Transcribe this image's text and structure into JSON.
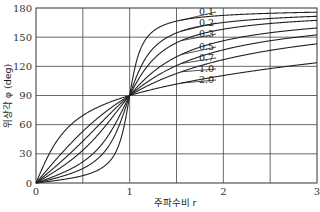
{
  "chart_data": {
    "type": "line",
    "title": "",
    "xlabel": "주파수비 r",
    "ylabel": "위상각 φ (deg)",
    "xlim": [
      0,
      3
    ],
    "ylim": [
      0,
      180
    ],
    "x_ticks": [
      "0",
      "1",
      "2",
      "3"
    ],
    "y_ticks": [
      "0",
      "30",
      "60",
      "90",
      "120",
      "150",
      "180"
    ],
    "grid": true,
    "x_grid": [
      0.5,
      1,
      1.5,
      2,
      2.5
    ],
    "y_grid": [
      30,
      60,
      90,
      120,
      150
    ],
    "legend_position": "inline labels near r=1.5",
    "series": [
      {
        "name": "0.1",
        "zeta": 0.1
      },
      {
        "name": "0.2",
        "zeta": 0.2
      },
      {
        "name": "0.3",
        "zeta": 0.3
      },
      {
        "name": "0.5",
        "zeta": 0.5
      },
      {
        "name": "0.7",
        "zeta": 0.7
      },
      {
        "name": "1.0",
        "zeta": 1.0
      },
      {
        "name": "2.0",
        "zeta": 2.0
      }
    ],
    "formula": "phi = atan2(2*zeta*r, 1 - r^2)"
  },
  "axes": {
    "x_tick_labels": [
      "0",
      "1",
      "2",
      "3"
    ],
    "y_tick_labels": [
      "0",
      "30",
      "60",
      "90",
      "120",
      "150",
      "180"
    ],
    "x_title": "주파수비 r",
    "y_title": "위상각 φ (deg)"
  },
  "curve_labels": [
    "0.1",
    "0.2",
    "0.3",
    "0.5",
    "0.7",
    "1.0",
    "2.0"
  ]
}
